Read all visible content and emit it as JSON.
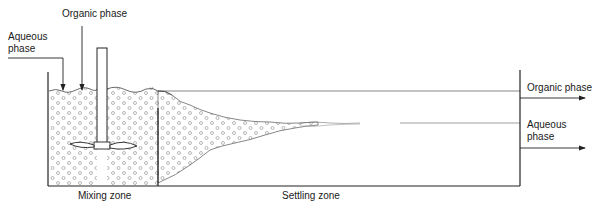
{
  "diagram": {
    "labels": {
      "organic_in": "Organic phase",
      "aqueous_in_line1": "Aqueous",
      "aqueous_in_line2": "phase",
      "organic_out": "Organic phase",
      "aqueous_out_line1": "Aqueous",
      "aqueous_out_line2": "phase",
      "mixing_zone": "Mixing zone",
      "settling_zone": "Settling zone"
    },
    "colors": {
      "line": "#333333",
      "droplet": "#9a9a9a",
      "background": "#ffffff"
    }
  }
}
